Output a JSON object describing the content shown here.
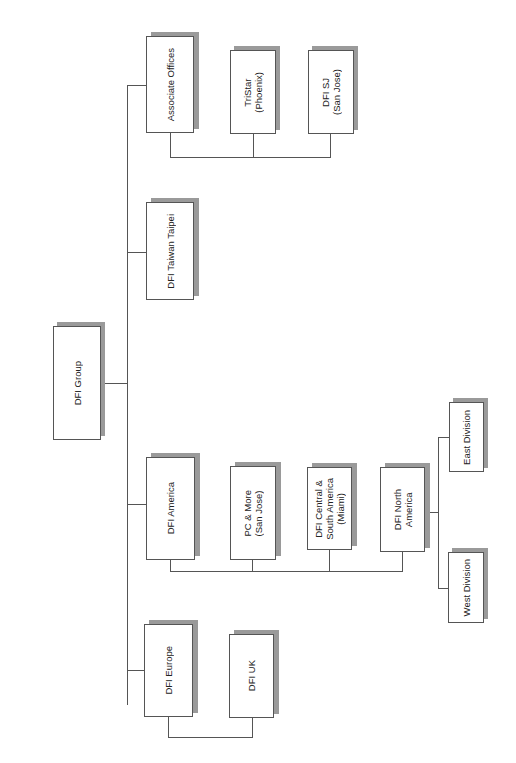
{
  "chart": {
    "title": "DFI Group",
    "orientation": "rotated-90-ccw",
    "colors": {
      "line": "#555555",
      "box_border": "#555555",
      "box_fill": "#ffffff",
      "shadow": "#9a9a9a",
      "text": "#222222"
    }
  },
  "nodes": {
    "root": {
      "label": "DFI Group"
    },
    "associate_offices": {
      "label": "Associate Offices"
    },
    "tristar": {
      "label": "TriStar\n(Phoenix)"
    },
    "dfi_sj": {
      "label": "DFI SJ\n(San Jose)"
    },
    "dfi_taiwan": {
      "label": "DFI Taiwan Taipei"
    },
    "dfi_america": {
      "label": "DFI America"
    },
    "pc_more": {
      "label": "PC & More\n(San Jose)"
    },
    "dfi_central_south": {
      "label": "DFI Central &\nSouth America\n(Miami)"
    },
    "dfi_north_america": {
      "label": "DFI North\nAmerica"
    },
    "east_division": {
      "label": "East Division"
    },
    "west_division": {
      "label": "West Division"
    },
    "dfi_europe": {
      "label": "DFI Europe"
    },
    "dfi_uk": {
      "label": "DFI UK"
    }
  },
  "hierarchy": [
    {
      "name": "DFI Group",
      "children": [
        {
          "name": "Associate Offices",
          "children": [
            {
              "name": "TriStar (Phoenix)"
            },
            {
              "name": "DFI SJ (San Jose)"
            }
          ]
        },
        {
          "name": "DFI Taiwan Taipei"
        },
        {
          "name": "DFI America",
          "children": [
            {
              "name": "PC & More (San Jose)"
            },
            {
              "name": "DFI Central & South America (Miami)"
            },
            {
              "name": "DFI North America",
              "children": [
                {
                  "name": "East Division"
                },
                {
                  "name": "West Division"
                }
              ]
            }
          ]
        },
        {
          "name": "DFI Europe",
          "children": [
            {
              "name": "DFI UK"
            }
          ]
        }
      ]
    }
  ]
}
